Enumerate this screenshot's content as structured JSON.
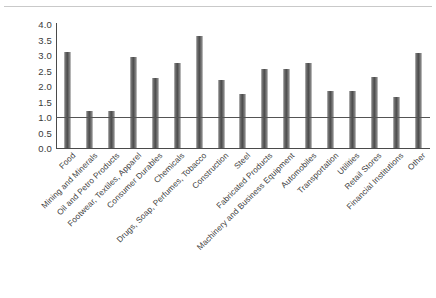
{
  "chart_data": {
    "type": "bar",
    "title": "",
    "subtitle": "",
    "xlabel": "",
    "ylabel": "",
    "ylim": [
      0.0,
      4.0
    ],
    "ytick_values": [
      4.0,
      3.5,
      3.0,
      2.5,
      2.0,
      1.5,
      1.0,
      0.5,
      0.0
    ],
    "ytick_labels": [
      "4.0",
      "3.5",
      "3.0",
      "2.5",
      "2.0",
      "1.5",
      "1.0",
      "0.5",
      "0.0"
    ],
    "grid": false,
    "legend": false,
    "legend_position": "none",
    "reference_line": {
      "value": 1.0,
      "orientation": "horizontal",
      "color": "#545454"
    },
    "bar_color": "#5a5a5a",
    "categories": [
      "Food",
      "Mining and Minerals",
      "Oil and Petro Products",
      "Footwear, Textiles, Apparel",
      "Consumer Durables",
      "Chemicals",
      "Drugs, Soap, Perfumes, Tobacco",
      "Construction",
      "Steel",
      "Fabricated Products",
      "Machinery and Business Equipment",
      "Automobiles",
      "Transportation",
      "Utilities",
      "Retail Stores",
      "Financial Institutions",
      "Other"
    ],
    "values": [
      3.1,
      1.2,
      1.2,
      2.95,
      2.25,
      2.75,
      3.6,
      2.2,
      1.75,
      2.55,
      2.55,
      2.75,
      1.85,
      1.85,
      2.3,
      1.65,
      3.05
    ]
  }
}
